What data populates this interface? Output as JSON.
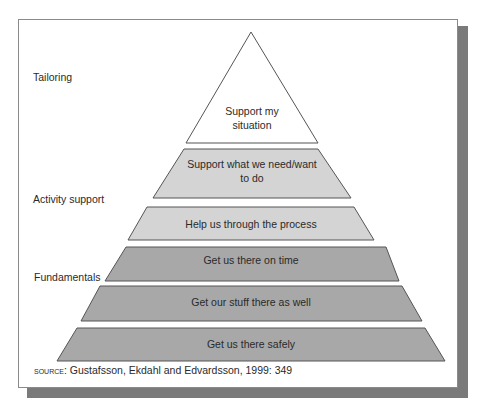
{
  "diagram": {
    "type": "pyramid",
    "tiers": [
      {
        "id": "tier-1",
        "label_lines": [
          "Support my",
          "situation"
        ],
        "shade": "white",
        "fill": "#ffffff"
      },
      {
        "id": "tier-2",
        "label_lines": [
          "Support what we need/want",
          "to do"
        ],
        "shade": "light",
        "fill": "#d4d4d4"
      },
      {
        "id": "tier-3",
        "label_lines": [
          "Help us through the process"
        ],
        "shade": "light",
        "fill": "#d4d4d4"
      },
      {
        "id": "tier-4",
        "label_lines": [
          "Get us there on time"
        ],
        "shade": "dark",
        "fill": "#a8a8a8"
      },
      {
        "id": "tier-5",
        "label_lines": [
          "Get our stuff there as well"
        ],
        "shade": "dark",
        "fill": "#a8a8a8"
      },
      {
        "id": "tier-6",
        "label_lines": [
          "Get us there safely"
        ],
        "shade": "dark",
        "fill": "#a8a8a8"
      }
    ],
    "stroke_color": "#555555"
  },
  "side_labels": {
    "tailoring": "Tailoring",
    "activity_support": "Activity support",
    "fundamentals": "Fundamentals"
  },
  "source": {
    "prefix": "Source",
    "text": ": Gustafsson, Ekdahl and Edvardsson, 1999: 349"
  },
  "colors": {
    "shadow": "#7a7a7a",
    "frame_border": "#8a8a8a",
    "text": "#2a2a2a"
  }
}
